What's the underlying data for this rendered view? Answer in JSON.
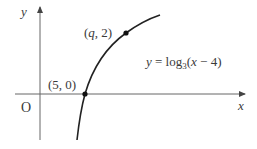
{
  "figure": {
    "axes": {
      "x_label": "x",
      "y_label": "y",
      "origin_label": "O"
    },
    "points": [
      {
        "label": "(5, 0)",
        "x": 5,
        "y": 0
      },
      {
        "label": "(q, 2)",
        "x": "q",
        "y": 2
      }
    ],
    "curve": {
      "equation_prefix": "y = log",
      "equation_base": "3",
      "equation_suffix": "(x − 4)"
    },
    "colors": {
      "axis": "#555555",
      "curve": "#222222",
      "text": "#3a3a3a"
    }
  }
}
